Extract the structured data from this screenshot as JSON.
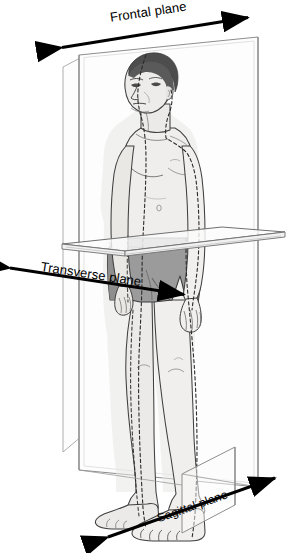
{
  "figure": {
    "background_color": "#ffffff"
  },
  "labels": {
    "frontal": "Frontal plane",
    "transverse": "Transverse plane",
    "sagittal": "Sagittal plane"
  },
  "icons": {
    "frontal_arrow": "double-headed-arrow-icon",
    "transverse_arrow": "double-headed-arrow-icon",
    "sagittal_arrow": "double-headed-arrow-icon"
  },
  "colors": {
    "arrow": "#000000",
    "label_text": "#000000",
    "plane_fill": "#fcfcfc",
    "plane_edge": "#8d8d8d",
    "skin": "#ededea",
    "skin_shadow": "#dcdcd8",
    "shorts": "#9b9b9b",
    "shorts_shadow": "#868686",
    "hair": "#4d4d4d",
    "outline": "#3a3a3a",
    "dashed_midline": "#2b2b2b",
    "ghost_silhouette": "#e6e6e4"
  },
  "planes": [
    {
      "name": "frontal",
      "label": "Frontal plane",
      "orientation": "vertical coronal panel, spans left-right behind the body",
      "arrow": {
        "x1": 60,
        "y1": 48,
        "x2": 250,
        "y2": 17,
        "double_headed": true
      }
    },
    {
      "name": "transverse",
      "label": "Transverse plane",
      "orientation": "horizontal panel through the hips",
      "arrow": {
        "x1": 8,
        "y1": 268,
        "x2": 186,
        "y2": 295,
        "double_headed": true
      }
    },
    {
      "name": "sagittal",
      "label": "Sagittal plane",
      "orientation": "vertical panel running front-to-back through the midline",
      "arrow": {
        "x1": 106,
        "y1": 538,
        "x2": 277,
        "y2": 477,
        "double_headed": true
      }
    }
  ]
}
